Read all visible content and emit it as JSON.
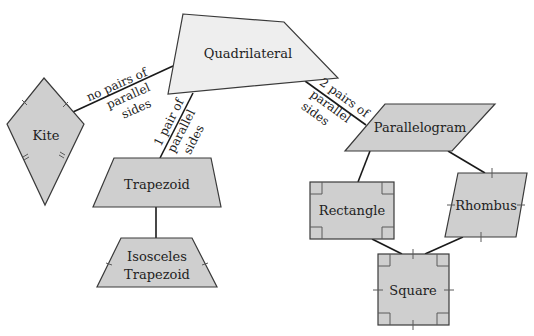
{
  "colors": {
    "quadrilateral_fill": "#eeeeee",
    "shape_fill": "#cfcfcf",
    "stroke": "#3a3a3a",
    "edge": "#1a1a1a",
    "text": "#222222"
  },
  "nodes": {
    "quadrilateral": {
      "label": "Quadrilateral"
    },
    "kite": {
      "label": "Kite"
    },
    "trapezoid": {
      "label": "Trapezoid"
    },
    "isosceles_trapezoid": {
      "label_line1": "Isosceles",
      "label_line2": "Trapezoid"
    },
    "parallelogram": {
      "label": "Parallelogram"
    },
    "rectangle": {
      "label": "Rectangle"
    },
    "rhombus": {
      "label": "Rhombus"
    },
    "square": {
      "label": "Square"
    }
  },
  "edges": {
    "to_kite": {
      "line1": "no pairs of",
      "line2": "parallel",
      "line3": "sides"
    },
    "to_trapezoid": {
      "line1": "1 pair of",
      "line2": "parallel",
      "line3": "sides"
    },
    "to_parallelogram": {
      "line1": "2 pairs of",
      "line2": "parallel",
      "line3": "sides"
    }
  }
}
